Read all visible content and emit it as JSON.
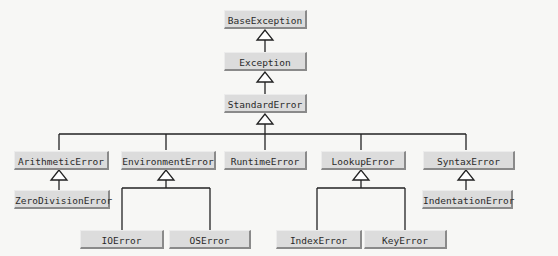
{
  "diagram": {
    "colors": {
      "box_fill": "#dcdcdc",
      "box_shadow": "#8a8a8a",
      "line": "#222222",
      "background": "#f7f7f5"
    },
    "nodes": {
      "base_exception": "BaseException",
      "exception": "Exception",
      "standard_error": "StandardError",
      "arithmetic_error": "ArithmeticError",
      "environment_error": "EnvironmentError",
      "runtime_error": "RuntimeError",
      "lookup_error": "LookupError",
      "syntax_error": "SyntaxError",
      "zero_division_error": "ZeroDivisionError",
      "indentation_error": "IndentationError",
      "io_error": "IOError",
      "os_error": "OSError",
      "index_error": "IndexError",
      "key_error": "KeyError"
    },
    "edges": [
      [
        "Exception",
        "BaseException"
      ],
      [
        "StandardError",
        "Exception"
      ],
      [
        "ArithmeticError",
        "StandardError"
      ],
      [
        "EnvironmentError",
        "StandardError"
      ],
      [
        "RuntimeError",
        "StandardError"
      ],
      [
        "LookupError",
        "StandardError"
      ],
      [
        "SyntaxError",
        "StandardError"
      ],
      [
        "ZeroDivisionError",
        "ArithmeticError"
      ],
      [
        "IOError",
        "EnvironmentError"
      ],
      [
        "OSError",
        "EnvironmentError"
      ],
      [
        "IndexError",
        "LookupError"
      ],
      [
        "KeyError",
        "LookupError"
      ],
      [
        "IndentationError",
        "SyntaxError"
      ]
    ]
  }
}
